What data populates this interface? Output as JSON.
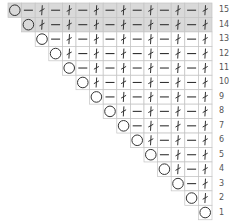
{
  "chart": {
    "title": "",
    "rows": 15,
    "columns": 15,
    "shaded_rows": [
      14,
      15
    ],
    "colors": {
      "shade": "#d9d9d9",
      "grid": "#c4c4c4",
      "symbol": "#333333",
      "background": "#ffffff"
    },
    "symbol_legend": {
      "O": "yarn-over",
      "-": "purl",
      "t": "knit-twisted"
    },
    "row_patterns": [
      {
        "row": 15,
        "label": "15",
        "cells": [
          "O",
          "-",
          "t",
          "-",
          "t",
          "-",
          "t",
          "-",
          "t",
          "-",
          "t",
          "-",
          "t",
          "-",
          "t"
        ]
      },
      {
        "row": 14,
        "label": "14",
        "cells": [
          "O",
          "t",
          "-",
          "t",
          "-",
          "t",
          "-",
          "t",
          "-",
          "t",
          "-",
          "t",
          "-",
          "t"
        ]
      },
      {
        "row": 13,
        "label": "13",
        "cells": [
          "O",
          "-",
          "t",
          "-",
          "t",
          "-",
          "t",
          "-",
          "t",
          "-",
          "t",
          "-",
          "t"
        ]
      },
      {
        "row": 12,
        "label": "12",
        "cells": [
          "O",
          "t",
          "-",
          "t",
          "-",
          "t",
          "-",
          "t",
          "-",
          "t",
          "-",
          "t"
        ]
      },
      {
        "row": 11,
        "label": "11",
        "cells": [
          "O",
          "-",
          "t",
          "-",
          "t",
          "-",
          "t",
          "-",
          "t",
          "-",
          "t"
        ]
      },
      {
        "row": 10,
        "label": "10",
        "cells": [
          "O",
          "t",
          "-",
          "t",
          "-",
          "t",
          "-",
          "t",
          "-",
          "t"
        ]
      },
      {
        "row": 9,
        "label": "9",
        "cells": [
          "O",
          "-",
          "t",
          "-",
          "t",
          "-",
          "t",
          "-",
          "t"
        ]
      },
      {
        "row": 8,
        "label": "8",
        "cells": [
          "O",
          "t",
          "-",
          "t",
          "-",
          "t",
          "-",
          "t"
        ]
      },
      {
        "row": 7,
        "label": "7",
        "cells": [
          "O",
          "-",
          "t",
          "-",
          "t",
          "-",
          "t"
        ]
      },
      {
        "row": 6,
        "label": "6",
        "cells": [
          "O",
          "t",
          "-",
          "t",
          "-",
          "t"
        ]
      },
      {
        "row": 5,
        "label": "5",
        "cells": [
          "O",
          "-",
          "t",
          "-",
          "t"
        ]
      },
      {
        "row": 4,
        "label": "4",
        "cells": [
          "O",
          "t",
          "-",
          "t"
        ]
      },
      {
        "row": 3,
        "label": "3",
        "cells": [
          "O",
          "-",
          "t"
        ]
      },
      {
        "row": 2,
        "label": "2",
        "cells": [
          "O",
          "t"
        ]
      },
      {
        "row": 1,
        "label": "1",
        "cells": [
          "O"
        ]
      }
    ]
  }
}
